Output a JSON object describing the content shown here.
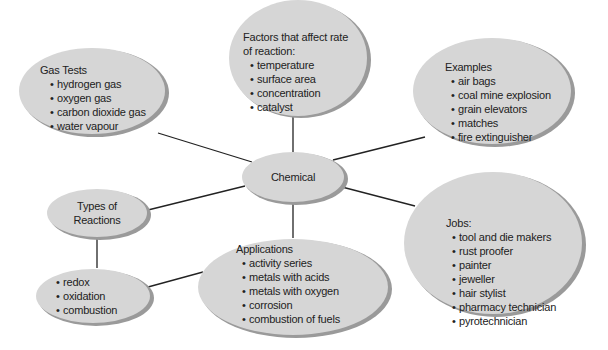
{
  "diagram": {
    "center": {
      "label": "Chemical"
    },
    "colors": {
      "fill": "#d6d6d6",
      "shadow": "#9a9a9a",
      "line": "#222222",
      "text": "#222222"
    },
    "nodes": {
      "gas_tests": {
        "title": "Gas Tests",
        "items": [
          "hydrogen gas",
          "oxygen gas",
          "carbon dioxide gas",
          "water vapour"
        ]
      },
      "factors": {
        "title_line1": "Factors that affect rate",
        "title_line2": "of reaction:",
        "items": [
          "temperature",
          "surface area",
          "concentration",
          "catalyst"
        ]
      },
      "examples": {
        "title": "Examples",
        "items": [
          "air bags",
          "coal mine explosion",
          "grain elevators",
          "matches",
          "fire extinguisher"
        ]
      },
      "jobs": {
        "title": "Jobs:",
        "items": [
          "tool and die makers",
          "rust proofer",
          "painter",
          "jeweller",
          "hair stylist",
          "pharmacy technician",
          "pyrotechnician"
        ]
      },
      "applications": {
        "title": "Applications",
        "items": [
          "activity series",
          "metals with acids",
          "metals with oxygen",
          "corrosion",
          "combustion of fuels"
        ]
      },
      "types": {
        "title_line1": "Types of",
        "title_line2": "Reactions"
      },
      "reaction_list": {
        "items": [
          "redox",
          "oxidation",
          "combustion"
        ]
      }
    }
  }
}
